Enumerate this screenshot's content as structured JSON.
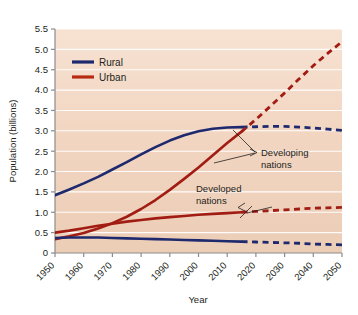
{
  "chart_data": {
    "type": "line",
    "title": "",
    "xlabel": "Year",
    "ylabel": "Population (billions)",
    "xlim": [
      1950,
      2050
    ],
    "ylim": [
      0,
      5.5
    ],
    "ytick_step": 0.5,
    "xtick_step": 10,
    "grid": true,
    "grid_color": "#ffffff",
    "plot_background": "#f3d9c6",
    "legend_position": "upper-left-inside",
    "projection_start_year": 2015,
    "note": "Solid segments are historical (1950-2015); dashed segments are projections (2015-2050).",
    "xticks": [
      "1950",
      "1960",
      "1970",
      "1980",
      "1990",
      "2000",
      "2010",
      "2020",
      "2030",
      "2040",
      "2050"
    ],
    "yticks": [
      "0",
      "0.5",
      "1.0",
      "1.5",
      "2.0",
      "2.5",
      "3.0",
      "3.5",
      "4.0",
      "4.5",
      "5.0",
      "5.5"
    ],
    "legend": [
      {
        "name": "Rural",
        "color": "#1f2a6e",
        "style": "solid"
      },
      {
        "name": "Urban",
        "color": "#b52b12",
        "style": "solid"
      }
    ],
    "annotations": [
      {
        "id": "developing",
        "line1": "Developing",
        "line2": "nations",
        "x": 2021,
        "y": 2.62
      },
      {
        "id": "developed",
        "line1": "Developed",
        "line2": "nations",
        "x": 2006,
        "y": 1.47
      }
    ],
    "series": [
      {
        "name": "Rural, developing nations",
        "group": "Developing",
        "type": "Rural",
        "color": "#1f2a6e",
        "x": [
          1950,
          1955,
          1960,
          1965,
          1970,
          1975,
          1980,
          1985,
          1990,
          1995,
          2000,
          2005,
          2010,
          2015,
          2020,
          2025,
          2030,
          2035,
          2040,
          2045,
          2050
        ],
        "values": [
          1.42,
          1.56,
          1.71,
          1.87,
          2.05,
          2.23,
          2.42,
          2.6,
          2.76,
          2.89,
          2.99,
          3.05,
          3.08,
          3.09,
          3.1,
          3.11,
          3.11,
          3.09,
          3.07,
          3.04,
          3.01
        ]
      },
      {
        "name": "Urban, developing nations",
        "group": "Developing",
        "type": "Urban",
        "color": "#a11c12",
        "x": [
          1950,
          1955,
          1960,
          1965,
          1970,
          1975,
          1980,
          1985,
          1990,
          1995,
          2000,
          2005,
          2010,
          2015,
          2020,
          2025,
          2030,
          2035,
          2040,
          2045,
          2050
        ],
        "values": [
          0.34,
          0.41,
          0.49,
          0.6,
          0.73,
          0.89,
          1.08,
          1.3,
          1.55,
          1.82,
          2.1,
          2.4,
          2.7,
          2.98,
          3.28,
          3.6,
          3.93,
          4.27,
          4.6,
          4.9,
          5.19
        ]
      },
      {
        "name": "Urban, developed nations",
        "group": "Developed",
        "type": "Urban",
        "color": "#a11c12",
        "x": [
          1950,
          1955,
          1960,
          1965,
          1970,
          1975,
          1980,
          1985,
          1990,
          1995,
          2000,
          2005,
          2010,
          2015,
          2020,
          2025,
          2030,
          2035,
          2040,
          2045,
          2050
        ],
        "values": [
          0.5,
          0.55,
          0.61,
          0.67,
          0.72,
          0.77,
          0.81,
          0.85,
          0.88,
          0.91,
          0.94,
          0.96,
          0.98,
          1.0,
          1.02,
          1.04,
          1.06,
          1.08,
          1.1,
          1.11,
          1.12
        ]
      },
      {
        "name": "Rural, developed nations",
        "group": "Developed",
        "type": "Rural",
        "color": "#1f2a6e",
        "x": [
          1950,
          1955,
          1960,
          1965,
          1970,
          1975,
          1980,
          1985,
          1990,
          1995,
          2000,
          2005,
          2010,
          2015,
          2020,
          2025,
          2030,
          2035,
          2040,
          2045,
          2050
        ],
        "values": [
          0.37,
          0.38,
          0.38,
          0.38,
          0.37,
          0.36,
          0.35,
          0.34,
          0.33,
          0.32,
          0.31,
          0.3,
          0.29,
          0.28,
          0.27,
          0.26,
          0.25,
          0.24,
          0.22,
          0.21,
          0.2
        ]
      }
    ]
  }
}
